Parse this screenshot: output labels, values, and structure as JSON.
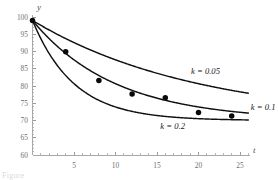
{
  "chart_data": {
    "type": "line",
    "title": "",
    "xlabel": "t",
    "ylabel": "y",
    "xlim": [
      0,
      26
    ],
    "ylim": [
      60,
      100
    ],
    "grid": false,
    "legend_position": "inline-right",
    "x_ticks": [
      5,
      10,
      15,
      20,
      25
    ],
    "x_tick_labels": [
      "5",
      "10",
      "15",
      "20",
      "25"
    ],
    "y_ticks": [
      60,
      65,
      70,
      75,
      80,
      85,
      90,
      95,
      100
    ],
    "y_tick_labels": [
      "60",
      "65",
      "70",
      "75",
      "80",
      "85",
      "90",
      "95",
      "100"
    ],
    "model": "y = 70 + 29 * exp(-k * t)",
    "asymptote": 70,
    "y_intercept": 99,
    "series": [
      {
        "name": "k = 0.05",
        "label": "k = 0.05",
        "k": 0.05,
        "label_x": 19.1,
        "label_y": 83.4,
        "x": [
          0,
          1,
          2,
          3,
          4,
          5,
          6,
          7,
          8,
          9,
          10,
          11,
          12,
          13,
          14,
          15,
          16,
          17,
          18,
          19,
          20,
          21,
          22,
          23,
          24,
          25,
          26
        ],
        "values": [
          99.0,
          97.6,
          96.2,
          94.9,
          93.7,
          92.6,
          91.5,
          90.4,
          89.4,
          88.5,
          87.6,
          86.7,
          85.9,
          85.2,
          84.4,
          83.7,
          83.0,
          82.4,
          81.8,
          81.2,
          80.7,
          80.1,
          79.6,
          79.2,
          78.7,
          78.3,
          77.9
        ]
      },
      {
        "name": "k = 0.1",
        "label": "k = 0.1",
        "k": 0.1,
        "label_x": 26.3,
        "label_y": 72.9,
        "x": [
          0,
          1,
          2,
          3,
          4,
          5,
          6,
          7,
          8,
          9,
          10,
          11,
          12,
          13,
          14,
          15,
          16,
          17,
          18,
          19,
          20,
          21,
          22,
          23,
          24,
          25,
          26
        ],
        "values": [
          99.0,
          96.2,
          93.7,
          91.5,
          89.4,
          87.6,
          85.9,
          84.4,
          83.0,
          81.8,
          80.7,
          79.6,
          78.7,
          77.9,
          77.1,
          76.5,
          75.9,
          75.3,
          74.8,
          74.4,
          73.9,
          73.6,
          73.2,
          72.9,
          72.6,
          72.4,
          72.1
        ]
      },
      {
        "name": "k = 0.2",
        "label": "k = 0.2",
        "k": 0.2,
        "label_x": 15.4,
        "label_y": 67.4,
        "x": [
          0,
          1,
          2,
          3,
          4,
          5,
          6,
          7,
          8,
          9,
          10,
          11,
          12,
          13,
          14,
          15,
          16,
          17,
          18,
          19,
          20,
          21,
          22,
          23,
          24,
          25,
          26
        ],
        "values": [
          99.0,
          93.7,
          89.4,
          85.9,
          83.0,
          80.7,
          78.7,
          77.1,
          75.9,
          74.8,
          73.9,
          73.2,
          72.6,
          72.1,
          71.8,
          71.4,
          71.2,
          71.0,
          70.8,
          70.6,
          70.5,
          70.4,
          70.4,
          70.3,
          70.2,
          70.2,
          70.2
        ]
      }
    ],
    "scatter": {
      "name": "observed data",
      "marker": "filled-circle",
      "color": "#0a0a0a",
      "points": [
        {
          "t": 0,
          "y": 99.0
        },
        {
          "t": 4,
          "y": 89.9
        },
        {
          "t": 8,
          "y": 81.6
        },
        {
          "t": 12,
          "y": 77.7
        },
        {
          "t": 16,
          "y": 76.6
        },
        {
          "t": 20,
          "y": 72.3
        },
        {
          "t": 24,
          "y": 71.3
        }
      ]
    }
  },
  "annotations": {
    "caption_fragment": "Figure"
  }
}
